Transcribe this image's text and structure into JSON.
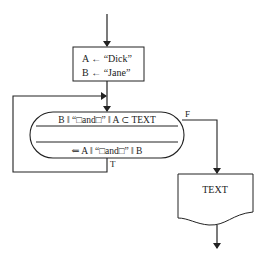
{
  "diagram": {
    "type": "flowchart",
    "assignment_box": {
      "line1": "A ← “Dick”",
      "line2": "B ← “Jane”"
    },
    "loop_block": {
      "condition": "B ‖ “□and□” ‖ A ⊂ TEXT",
      "action": "⇐ A ‖ “□and□” ‖ B"
    },
    "branch_labels": {
      "false": "F",
      "true": "T"
    },
    "output_document": {
      "label": "TEXT"
    },
    "colors": {
      "stroke": "#222222",
      "background": "#ffffff"
    }
  }
}
